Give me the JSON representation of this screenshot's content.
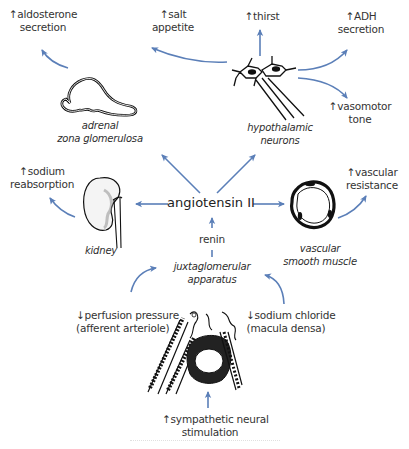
{
  "center": {
    "label": "angiotensin II"
  },
  "intermediate": {
    "label": "renin"
  },
  "structures": {
    "adrenal": {
      "line1": "adrenal",
      "line2": "zona glomerulosa",
      "icon": "adrenal-gland-icon"
    },
    "hypothalamic": {
      "line1": "hypothalamic",
      "line2": "neurons",
      "icon": "neuron-icon"
    },
    "kidney": {
      "line1": "kidney",
      "icon": "kidney-icon"
    },
    "vascular": {
      "line1": "vascular",
      "line2": "smooth muscle",
      "icon": "blood-vessel-icon"
    },
    "jga": {
      "line1": "juxtaglomerular",
      "line2": "apparatus",
      "icon": "juxtaglomerular-apparatus-icon"
    }
  },
  "effects": {
    "aldosterone": {
      "line1": "↑aldosterone",
      "line2": "secretion"
    },
    "salt": {
      "line1": "↑salt",
      "line2": "appetite"
    },
    "thirst": {
      "line1": "↑thirst"
    },
    "adh": {
      "line1": "↑ADH",
      "line2": "secretion"
    },
    "vasomotor": {
      "line1": "↑vasomotor",
      "line2": "tone"
    },
    "sodium": {
      "line1": "↑sodium",
      "line2": "reabsorption"
    },
    "vascular_res": {
      "line1": "↑vascular",
      "line2": "resistance"
    }
  },
  "stimuli": {
    "perfusion": {
      "line1": "↓perfusion pressure",
      "line2": "(afferent arteriole)"
    },
    "sodium_chloride": {
      "line1": "↓sodium chloride",
      "line2": "(macula densa)"
    },
    "sympathetic": {
      "line1": "↑sympathetic neural",
      "line2": "stimulation"
    }
  },
  "colors": {
    "arrow": "#5b7fb8",
    "drawing": "#111111",
    "text": "#333333",
    "background": "#ffffff"
  }
}
